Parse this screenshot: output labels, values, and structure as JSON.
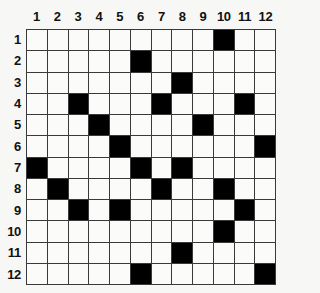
{
  "puzzle": {
    "type": "crossword-grid",
    "size": 12,
    "column_headers": [
      "1",
      "2",
      "3",
      "4",
      "5",
      "6",
      "7",
      "8",
      "9",
      "10",
      "11",
      "12"
    ],
    "row_headers": [
      "1",
      "2",
      "3",
      "4",
      "5",
      "6",
      "7",
      "8",
      "9",
      "10",
      "11",
      "12"
    ],
    "colors": {
      "page_background": "#f7f7f5",
      "cell_empty": "#fbfbf9",
      "cell_filled": "#000000",
      "grid_line": "#3a3a3a",
      "label_text": "#111111"
    },
    "filled_cells_by_row": [
      [
        10
      ],
      [
        6
      ],
      [
        8
      ],
      [
        3,
        7,
        11
      ],
      [
        4,
        9
      ],
      [
        5,
        12
      ],
      [
        1,
        6,
        8
      ],
      [
        2,
        7,
        10
      ],
      [
        3,
        5,
        11
      ],
      [
        10
      ],
      [
        8
      ],
      [
        6,
        12
      ]
    ],
    "grid": [
      [
        0,
        0,
        0,
        0,
        0,
        0,
        0,
        0,
        0,
        1,
        0,
        0
      ],
      [
        0,
        0,
        0,
        0,
        0,
        1,
        0,
        0,
        0,
        0,
        0,
        0
      ],
      [
        0,
        0,
        0,
        0,
        0,
        0,
        0,
        1,
        0,
        0,
        0,
        0
      ],
      [
        0,
        0,
        1,
        0,
        0,
        0,
        1,
        0,
        0,
        0,
        1,
        0
      ],
      [
        0,
        0,
        0,
        1,
        0,
        0,
        0,
        0,
        1,
        0,
        0,
        0
      ],
      [
        0,
        0,
        0,
        0,
        1,
        0,
        0,
        0,
        0,
        0,
        0,
        1
      ],
      [
        1,
        0,
        0,
        0,
        0,
        1,
        0,
        1,
        0,
        0,
        0,
        0
      ],
      [
        0,
        1,
        0,
        0,
        0,
        0,
        1,
        0,
        0,
        1,
        0,
        0
      ],
      [
        0,
        0,
        1,
        0,
        1,
        0,
        0,
        0,
        0,
        0,
        1,
        0
      ],
      [
        0,
        0,
        0,
        0,
        0,
        0,
        0,
        0,
        0,
        1,
        0,
        0
      ],
      [
        0,
        0,
        0,
        0,
        0,
        0,
        0,
        1,
        0,
        0,
        0,
        0
      ],
      [
        0,
        0,
        0,
        0,
        0,
        1,
        0,
        0,
        0,
        0,
        0,
        1
      ]
    ],
    "filled_count": 23
  }
}
